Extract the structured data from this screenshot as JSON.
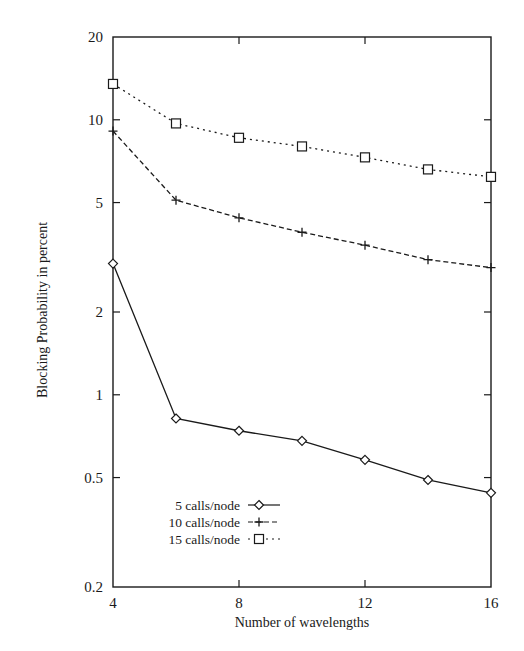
{
  "chart_data": {
    "type": "line",
    "title": "",
    "xlabel": "Number of wavelengths",
    "ylabel": "Blocking Probability in percent",
    "x": [
      4,
      6,
      8,
      10,
      12,
      14,
      16
    ],
    "xlim": [
      4,
      16
    ],
    "ylim": [
      0.2,
      20
    ],
    "yscale": "log",
    "x_ticks": [
      4,
      8,
      12,
      16
    ],
    "x_tick_labels": [
      "4",
      "8",
      "12",
      "16"
    ],
    "y_ticks": [
      0.2,
      0.5,
      1,
      2,
      5,
      10,
      20
    ],
    "y_tick_labels": [
      "0.2",
      "0.5",
      "1",
      "2",
      "5",
      "10",
      "20"
    ],
    "grid": false,
    "legend_position": "lower-left (inside plot)",
    "series": [
      {
        "name": "5 calls/node",
        "marker": "diamond",
        "line_style": "solid",
        "values": [
          3.0,
          0.82,
          0.74,
          0.68,
          0.58,
          0.49,
          0.44
        ]
      },
      {
        "name": "10 calls/node",
        "marker": "plus",
        "line_style": "dashed",
        "values": [
          9.1,
          5.1,
          4.4,
          3.9,
          3.5,
          3.1,
          2.9
        ]
      },
      {
        "name": "15 calls/node",
        "marker": "square",
        "line_style": "dotted",
        "values": [
          13.5,
          9.7,
          8.6,
          8.0,
          7.3,
          6.6,
          6.2
        ]
      }
    ]
  },
  "colors": {
    "ink": "#1a1a1a",
    "background": "#ffffff"
  }
}
